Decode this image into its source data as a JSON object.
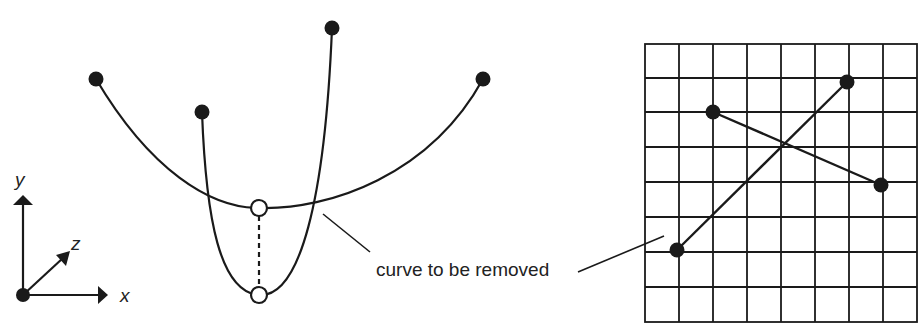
{
  "axes": {
    "x_label": "x",
    "y_label": "y",
    "z_label": "z"
  },
  "callout": {
    "text": "curve to be removed"
  },
  "colors": {
    "stroke": "#1a1a1a",
    "background": "#ffffff"
  },
  "curves": {
    "wide_curve": {
      "start": [
        96,
        79
      ],
      "end": [
        483,
        79
      ],
      "min": [
        259,
        208
      ]
    },
    "narrow_curve": {
      "start": [
        202,
        112
      ],
      "end": [
        332,
        28
      ],
      "min": [
        259,
        295
      ]
    },
    "open_points": [
      [
        259,
        208
      ],
      [
        259,
        295
      ]
    ]
  },
  "grid": {
    "columns": 8,
    "rows": 8,
    "points": [
      [
        713,
        112
      ],
      [
        881,
        185
      ],
      [
        847,
        82
      ],
      [
        677,
        250
      ]
    ]
  }
}
